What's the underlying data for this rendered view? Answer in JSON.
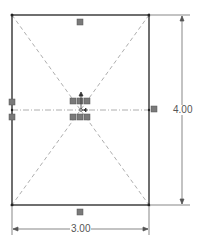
{
  "sketch": {
    "rectangle": {
      "x1": 12,
      "y1": 15,
      "x2": 149,
      "y2": 205
    },
    "center": {
      "x": 81,
      "y": 110
    },
    "colors": {
      "line": "#333333",
      "construction": "#888888",
      "marker": "#777777",
      "dim": "#555555"
    }
  },
  "dimensions": {
    "height_label": "4.00",
    "width_label": "3.00"
  },
  "relations": {
    "top": "horizontal-relation",
    "bottom": "horizontal-relation",
    "left": "vertical-relation",
    "right": "vertical-relation",
    "center": "midpoint-relation"
  }
}
